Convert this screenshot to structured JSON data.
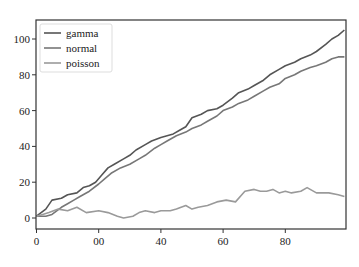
{
  "chart_data": {
    "type": "line",
    "title": "",
    "xlabel": "",
    "ylabel": "",
    "xlim": [
      0,
      99
    ],
    "ylim": [
      -5,
      110
    ],
    "grid": false,
    "legend_position": "upper left",
    "x_ticks": [
      0,
      20,
      40,
      60,
      80
    ],
    "x_tick_labels": [
      "0",
      "00",
      "40",
      "60",
      "80"
    ],
    "y_ticks": [
      0,
      20,
      40,
      60,
      80,
      100
    ],
    "y_tick_labels": [
      "0",
      "20",
      "40",
      "60",
      "80",
      "100"
    ],
    "series": [
      {
        "name": "gamma",
        "color": "#555555",
        "x": [
          0,
          3,
          5,
          8,
          10,
          13,
          15,
          17,
          19,
          21,
          23,
          25,
          28,
          30,
          32,
          35,
          37,
          40,
          42,
          44,
          46,
          48,
          50,
          53,
          55,
          58,
          60,
          63,
          65,
          68,
          70,
          73,
          75,
          78,
          80,
          83,
          85,
          88,
          90,
          93,
          95,
          97,
          99
        ],
        "values": [
          1,
          5,
          10,
          11,
          13,
          14,
          17,
          18,
          20,
          24,
          28,
          30,
          33,
          35,
          38,
          41,
          43,
          45,
          46,
          47,
          49,
          51,
          56,
          58,
          60,
          61,
          63,
          67,
          70,
          72,
          74,
          77,
          80,
          83,
          85,
          87,
          89,
          91,
          93,
          97,
          100,
          102,
          105
        ]
      },
      {
        "name": "normal",
        "color": "#777777",
        "x": [
          0,
          3,
          5,
          8,
          10,
          12,
          14,
          17,
          20,
          22,
          24,
          27,
          30,
          33,
          35,
          38,
          40,
          42,
          45,
          48,
          50,
          53,
          55,
          58,
          60,
          63,
          65,
          68,
          70,
          73,
          75,
          78,
          80,
          83,
          85,
          88,
          90,
          93,
          95,
          97,
          99
        ],
        "values": [
          1,
          1,
          2,
          6,
          8,
          10,
          12,
          15,
          19,
          22,
          25,
          28,
          30,
          33,
          35,
          39,
          41,
          43,
          46,
          48,
          50,
          52,
          54,
          57,
          60,
          62,
          64,
          66,
          68,
          71,
          73,
          75,
          78,
          80,
          82,
          84,
          85,
          87,
          89,
          90,
          90
        ]
      },
      {
        "name": "poisson",
        "color": "#9a9a9a",
        "x": [
          0,
          2,
          4,
          7,
          10,
          13,
          16,
          20,
          23,
          26,
          28,
          31,
          33,
          35,
          38,
          40,
          43,
          45,
          48,
          50,
          52,
          55,
          58,
          61,
          64,
          66,
          67,
          70,
          72,
          74,
          76,
          78,
          80,
          82,
          85,
          87,
          88,
          90,
          92,
          94,
          97,
          99
        ],
        "values": [
          1,
          2,
          3,
          5,
          4,
          6,
          3,
          4,
          3,
          1,
          0,
          1,
          3,
          4,
          3,
          4,
          4,
          5,
          7,
          5,
          6,
          7,
          9,
          10,
          9,
          13,
          15,
          16,
          15,
          15,
          16,
          14,
          15,
          14,
          15,
          17,
          16,
          14,
          14,
          14,
          13,
          12
        ]
      }
    ]
  },
  "footer_note": ""
}
